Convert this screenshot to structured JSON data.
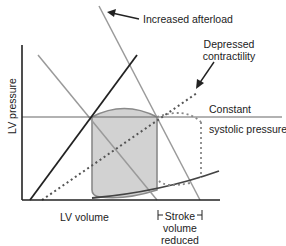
{
  "axes": {
    "x_label": "LV volume",
    "y_label": "LV pressure"
  },
  "annotations": {
    "increased_afterload": "Increased afterload",
    "depressed_contractility_line1": "Depressed",
    "depressed_contractility_line2": "contractility",
    "constant_line1": "Constant",
    "constant_line2": "systolic pressure",
    "stroke_volume_line1": "Stroke",
    "stroke_volume_line2": "volume",
    "stroke_volume_line3": "reduced"
  },
  "colors": {
    "axis": "#222222",
    "espvr_normal": "#222222",
    "espvr_depressed": "#555555",
    "afterload_lines": "#9a9a9a",
    "loop_fill": "#d2d2d2",
    "loop_stroke": "#8a8a8a",
    "constant_line": "#666666"
  }
}
